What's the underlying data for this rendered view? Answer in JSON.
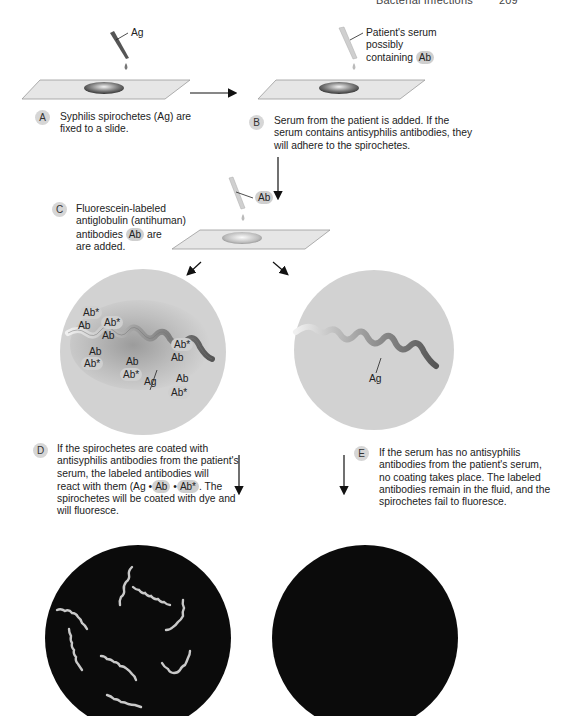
{
  "header": {
    "section": "Bacterial Infections",
    "page": "209"
  },
  "steps": {
    "A": {
      "letter": "A",
      "caption_line1": "Syphilis spirochetes (Ag) are",
      "caption_line2": "fixed to a slide.",
      "pipette_label": "Ag"
    },
    "B": {
      "letter": "B",
      "caption_line1": "Serum from the patient is added. If the",
      "caption_line2": "serum contains antisyphilis antibodies, they",
      "caption_line3": "will adhere to the spirochetes.",
      "pipette_label_line1": "Patient's serum",
      "pipette_label_line2": "possibly",
      "pipette_label_line3": "containing",
      "pipette_badge": "Ab"
    },
    "C": {
      "letter": "C",
      "caption_line1": "Fluorescein-labeled",
      "caption_line2": "antiglobulin (antihuman)",
      "caption_line3_pre": "antibodies",
      "caption_line3_badge": "Ab",
      "caption_line3_post": "are",
      "caption_line4": "are added.",
      "pipette_badge": "Ab"
    },
    "D": {
      "letter": "D",
      "caption_line1": "If the spirochetes are coated with",
      "caption_line2": "antisyphilis antibodies from the patient's",
      "caption_line3": "serum, the labeled antibodies will",
      "caption_line4_pre": "react with them (Ag •",
      "caption_line4_badge1": "Ab",
      "caption_line4_mid": "•",
      "caption_line4_badge2": "Ab*",
      "caption_line4_post": ". The",
      "caption_line5": "spirochetes will be coated with dye and",
      "caption_line6": "will fluoresce."
    },
    "E": {
      "letter": "E",
      "caption_line1": "If the serum has no antisyphilis",
      "caption_line2": "antibodies from the patient's serum,",
      "caption_line3": "no coating takes place. The labeled",
      "caption_line4": "antibodies remain in the fluid, and the",
      "caption_line5": "spirochetes fail to fluoresce."
    }
  },
  "magnified_left": {
    "labels": {
      "ab_star": "Ab*",
      "ab": "Ab",
      "ag": "Ag"
    }
  },
  "magnified_right": {
    "labels": {
      "ag": "Ag"
    }
  },
  "colors": {
    "slide": "#e4e4e4",
    "circle_bg": "#d2d2d2",
    "dark_field": "#0b0b0b",
    "fluorescent_spirochete": "#c9c9c9",
    "badge_fill": "#cfcfcf"
  }
}
